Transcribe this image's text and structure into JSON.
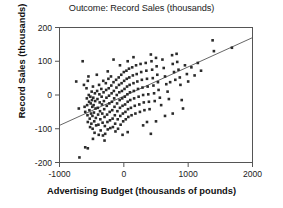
{
  "chart_data": {
    "type": "scatter",
    "title": "Outcome: Record Sales (thousands)",
    "xlabel": "Advertising Budget (thousands of pounds)",
    "ylabel": "Record Sales (thousands)",
    "xlim": [
      -1000,
      2000
    ],
    "ylim": [
      -200,
      200
    ],
    "xticks": [
      -1000,
      0,
      1000,
      2000
    ],
    "xtick_labels": [
      "-1000",
      "0",
      "1000",
      "2000"
    ],
    "yticks": [
      -200,
      -100,
      0,
      100,
      200
    ],
    "ytick_labels": [
      "-200",
      "-100",
      "0",
      "100",
      "200"
    ],
    "grid": false,
    "legend": null,
    "marker": "square",
    "marker_color": "#2b2b2b",
    "marker_size": 2.6,
    "frame_color": "#555555",
    "trendline": {
      "name": "regression line",
      "color": "#555555",
      "x": [
        -1000,
        2000
      ],
      "y": [
        -90,
        170
      ]
    },
    "points": [
      [
        -740,
        40
      ],
      [
        -700,
        -40
      ],
      [
        -690,
        -185
      ],
      [
        -640,
        100
      ],
      [
        -620,
        30
      ],
      [
        -610,
        -35
      ],
      [
        -600,
        -50
      ],
      [
        -600,
        -155
      ],
      [
        -580,
        20
      ],
      [
        -575,
        -10
      ],
      [
        -570,
        -30
      ],
      [
        -565,
        -60
      ],
      [
        -560,
        -80
      ],
      [
        -560,
        -158
      ],
      [
        -550,
        55
      ],
      [
        -545,
        0
      ],
      [
        -540,
        -20
      ],
      [
        -535,
        -45
      ],
      [
        -530,
        -70
      ],
      [
        -525,
        -95
      ],
      [
        -520,
        -5
      ],
      [
        -515,
        -25
      ],
      [
        -510,
        -55
      ],
      [
        -505,
        -85
      ],
      [
        -500,
        10
      ],
      [
        -495,
        -15
      ],
      [
        -490,
        -35
      ],
      [
        -488,
        -62
      ],
      [
        -485,
        -100
      ],
      [
        -480,
        25
      ],
      [
        -475,
        -8
      ],
      [
        -470,
        -30
      ],
      [
        -465,
        -52
      ],
      [
        -460,
        -78
      ],
      [
        -455,
        -112
      ],
      [
        -450,
        5
      ],
      [
        -445,
        -18
      ],
      [
        -440,
        -40
      ],
      [
        -435,
        -68
      ],
      [
        -430,
        -90
      ],
      [
        -420,
        60
      ],
      [
        -415,
        12
      ],
      [
        -410,
        -12
      ],
      [
        -405,
        -38
      ],
      [
        -400,
        -58
      ],
      [
        -395,
        -88
      ],
      [
        -390,
        -118
      ],
      [
        -385,
        30
      ],
      [
        -380,
        2
      ],
      [
        -375,
        -22
      ],
      [
        -370,
        -48
      ],
      [
        -365,
        -72
      ],
      [
        -360,
        -105
      ],
      [
        -350,
        18
      ],
      [
        -345,
        -5
      ],
      [
        -340,
        -28
      ],
      [
        -335,
        -55
      ],
      [
        -330,
        -82
      ],
      [
        -325,
        -120
      ],
      [
        -320,
        42
      ],
      [
        -315,
        8
      ],
      [
        -310,
        -18
      ],
      [
        -305,
        -42
      ],
      [
        -300,
        -65
      ],
      [
        -295,
        -92
      ],
      [
        -290,
        -115
      ],
      [
        -280,
        35
      ],
      [
        -275,
        15
      ],
      [
        -270,
        -8
      ],
      [
        -265,
        -32
      ],
      [
        -260,
        -58
      ],
      [
        -255,
        -80
      ],
      [
        -250,
        -102
      ],
      [
        -240,
        48
      ],
      [
        -235,
        20
      ],
      [
        -230,
        -2
      ],
      [
        -225,
        -25
      ],
      [
        -220,
        -50
      ],
      [
        -215,
        -75
      ],
      [
        -210,
        -98
      ],
      [
        -200,
        55
      ],
      [
        -195,
        28
      ],
      [
        -190,
        5
      ],
      [
        -185,
        -20
      ],
      [
        -180,
        -45
      ],
      [
        -175,
        -70
      ],
      [
        -170,
        -95
      ],
      [
        -160,
        38
      ],
      [
        -155,
        12
      ],
      [
        -150,
        -10
      ],
      [
        -145,
        -35
      ],
      [
        -140,
        -60
      ],
      [
        -135,
        -85
      ],
      [
        -130,
        -108
      ],
      [
        -120,
        45
      ],
      [
        -115,
        22
      ],
      [
        -110,
        0
      ],
      [
        -105,
        -25
      ],
      [
        -100,
        -48
      ],
      [
        -95,
        -72
      ],
      [
        -90,
        -100
      ],
      [
        -80,
        52
      ],
      [
        -75,
        30
      ],
      [
        -70,
        8
      ],
      [
        -65,
        -15
      ],
      [
        -60,
        -38
      ],
      [
        -55,
        -62
      ],
      [
        -50,
        -88
      ],
      [
        -40,
        60
      ],
      [
        -35,
        35
      ],
      [
        -30,
        12
      ],
      [
        -25,
        -10
      ],
      [
        -20,
        -32
      ],
      [
        -15,
        -55
      ],
      [
        -10,
        -78
      ],
      [
        0,
        68
      ],
      [
        5,
        42
      ],
      [
        10,
        18
      ],
      [
        15,
        -5
      ],
      [
        20,
        -28
      ],
      [
        25,
        -50
      ],
      [
        30,
        -72
      ],
      [
        40,
        72
      ],
      [
        45,
        48
      ],
      [
        50,
        25
      ],
      [
        55,
        2
      ],
      [
        60,
        -20
      ],
      [
        65,
        -42
      ],
      [
        70,
        -65
      ],
      [
        80,
        78
      ],
      [
        85,
        52
      ],
      [
        90,
        30
      ],
      [
        95,
        8
      ],
      [
        100,
        -15
      ],
      [
        110,
        -38
      ],
      [
        120,
        -60
      ],
      [
        130,
        82
      ],
      [
        140,
        58
      ],
      [
        150,
        35
      ],
      [
        155,
        12
      ],
      [
        160,
        -10
      ],
      [
        170,
        -32
      ],
      [
        180,
        -55
      ],
      [
        190,
        88
      ],
      [
        200,
        62
      ],
      [
        210,
        40
      ],
      [
        220,
        18
      ],
      [
        230,
        -5
      ],
      [
        240,
        -28
      ],
      [
        250,
        -50
      ],
      [
        260,
        92
      ],
      [
        270,
        68
      ],
      [
        280,
        45
      ],
      [
        290,
        22
      ],
      [
        300,
        0
      ],
      [
        310,
        -22
      ],
      [
        320,
        -45
      ],
      [
        340,
        95
      ],
      [
        350,
        72
      ],
      [
        360,
        48
      ],
      [
        370,
        25
      ],
      [
        380,
        2
      ],
      [
        390,
        -20
      ],
      [
        400,
        -42
      ],
      [
        420,
        120
      ],
      [
        430,
        100
      ],
      [
        440,
        75
      ],
      [
        450,
        50
      ],
      [
        460,
        28
      ],
      [
        470,
        5
      ],
      [
        480,
        -18
      ],
      [
        500,
        110
      ],
      [
        510,
        85
      ],
      [
        520,
        60
      ],
      [
        530,
        38
      ],
      [
        540,
        15
      ],
      [
        560,
        -8
      ],
      [
        580,
        -30
      ],
      [
        600,
        105
      ],
      [
        620,
        80
      ],
      [
        640,
        55
      ],
      [
        660,
        32
      ],
      [
        680,
        10
      ],
      [
        700,
        -12
      ],
      [
        720,
        38
      ],
      [
        750,
        118
      ],
      [
        760,
        92
      ],
      [
        780,
        68
      ],
      [
        800,
        45
      ],
      [
        820,
        122
      ],
      [
        830,
        98
      ],
      [
        850,
        75
      ],
      [
        870,
        52
      ],
      [
        880,
        30
      ],
      [
        900,
        -15
      ],
      [
        920,
        -40
      ],
      [
        950,
        88
      ],
      [
        980,
        62
      ],
      [
        1000,
        40
      ],
      [
        1050,
        82
      ],
      [
        1100,
        58
      ],
      [
        1150,
        95
      ],
      [
        1200,
        72
      ],
      [
        1380,
        162
      ],
      [
        1400,
        130
      ],
      [
        1680,
        140
      ],
      [
        -560,
        42
      ],
      [
        -480,
        -130
      ],
      [
        -300,
        -135
      ],
      [
        -250,
        70
      ],
      [
        -160,
        105
      ],
      [
        -60,
        88
      ],
      [
        60,
        100
      ],
      [
        150,
        112
      ],
      [
        300,
        -90
      ],
      [
        360,
        -80
      ],
      [
        420,
        -115
      ],
      [
        500,
        -78
      ],
      [
        640,
        -62
      ],
      [
        760,
        -55
      ],
      [
        60,
        -110
      ],
      [
        -20,
        -118
      ]
    ]
  }
}
